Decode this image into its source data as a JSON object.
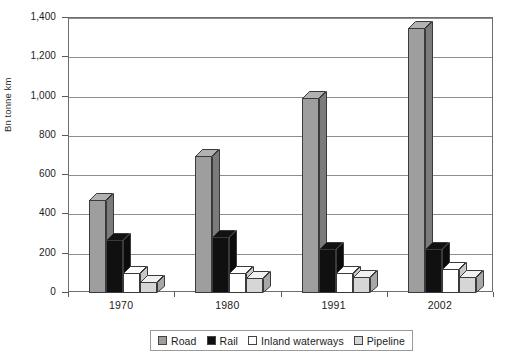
{
  "chart_data": {
    "type": "bar",
    "title": "",
    "xlabel": "",
    "ylabel": "Bn tonne km",
    "ylim": [
      0,
      1400
    ],
    "ytick_step": 200,
    "ytick_labels": [
      "1,400",
      "1,200",
      "1,000",
      "800",
      "600",
      "400",
      "200",
      "0"
    ],
    "ytick_values": [
      1400,
      1200,
      1000,
      800,
      600,
      400,
      200,
      0
    ],
    "grid": true,
    "legend_position": "bottom",
    "categories": [
      "1970",
      "1980",
      "1991",
      "2002"
    ],
    "series": [
      {
        "name": "Road",
        "color": "#9e9e9e",
        "values": [
          475,
          700,
          995,
          1350
        ]
      },
      {
        "name": "Rail",
        "color": "#101010",
        "values": [
          270,
          285,
          225,
          225
        ]
      },
      {
        "name": "Inland waterways",
        "color": "#ffffff",
        "values": [
          100,
          100,
          100,
          120
        ]
      },
      {
        "name": "Pipeline",
        "color": "#d6d6d6",
        "values": [
          55,
          75,
          80,
          80
        ]
      }
    ]
  },
  "legend": {
    "items": [
      {
        "label": "Road",
        "swatch": "#9e9e9e"
      },
      {
        "label": "Rail",
        "swatch": "#101010"
      },
      {
        "label": "Inland waterways",
        "swatch": "#ffffff"
      },
      {
        "label": "Pipeline",
        "swatch": "#d6d6d6"
      }
    ]
  },
  "axes": {
    "y_title": "Bn tonne km"
  }
}
